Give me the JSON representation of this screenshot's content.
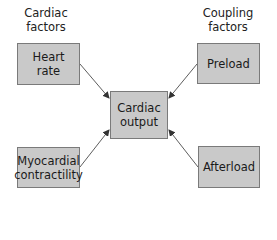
{
  "diagram": {
    "groups": {
      "left": "Cardiac\nfactors",
      "right": "Coupling\nfactors"
    },
    "nodes": {
      "heart_rate": {
        "line1": "Heart",
        "line2": "rate"
      },
      "preload": {
        "line1": "Preload"
      },
      "cardiac_output": {
        "line1": "Cardiac",
        "line2": "output"
      },
      "contractility": {
        "line1": "Myocardial",
        "line2": "contractility"
      },
      "afterload": {
        "line1": "Afterload"
      }
    },
    "edges": [
      {
        "from": "Heart rate",
        "to": "Cardiac output"
      },
      {
        "from": "Preload",
        "to": "Cardiac output"
      },
      {
        "from": "Myocardial contractility",
        "to": "Cardiac output"
      },
      {
        "from": "Afterload",
        "to": "Cardiac output"
      }
    ],
    "colors": {
      "box_fill": "#c9c9c9",
      "box_border": "#7a7a7a",
      "arrow": "#333333"
    }
  }
}
